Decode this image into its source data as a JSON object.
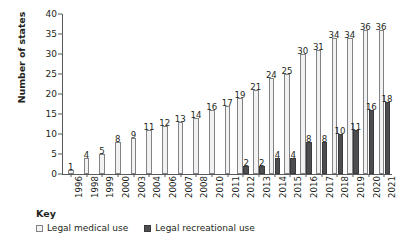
{
  "chart_data": {
    "type": "bar",
    "title": "",
    "xlabel": "",
    "ylabel": "Number of states",
    "ylim": [
      0,
      40
    ],
    "yticks": [
      0,
      5,
      10,
      15,
      20,
      25,
      30,
      35,
      40
    ],
    "grid": false,
    "legend_position": "bottom-left",
    "legend_title": "Key",
    "categories": [
      "1996",
      "1998",
      "1999",
      "2000",
      "2003",
      "2004",
      "2006",
      "2007",
      "2008",
      "2010",
      "2011",
      "2012",
      "2013",
      "2014",
      "2015",
      "2016",
      "2017",
      "2018",
      "2019",
      "2020",
      "2021"
    ],
    "series": [
      {
        "name": "Legal medical use",
        "color": "#f2f2f2",
        "values": [
          1,
          4,
          5,
          8,
          9,
          11,
          12,
          13,
          14,
          16,
          17,
          19,
          21,
          24,
          25,
          30,
          31,
          34,
          34,
          36,
          36
        ]
      },
      {
        "name": "Legal recreational use",
        "color": "#4d4d4f",
        "values": [
          null,
          null,
          null,
          null,
          null,
          null,
          null,
          null,
          null,
          null,
          null,
          2,
          2,
          4,
          4,
          8,
          8,
          10,
          11,
          16,
          18
        ]
      }
    ]
  },
  "axis": {
    "y_title": "Number of states"
  },
  "legend": {
    "title": "Key",
    "items": [
      {
        "label": "Legal medical use",
        "swatch": "medical"
      },
      {
        "label": "Legal recreational use",
        "swatch": "recreational"
      }
    ]
  }
}
